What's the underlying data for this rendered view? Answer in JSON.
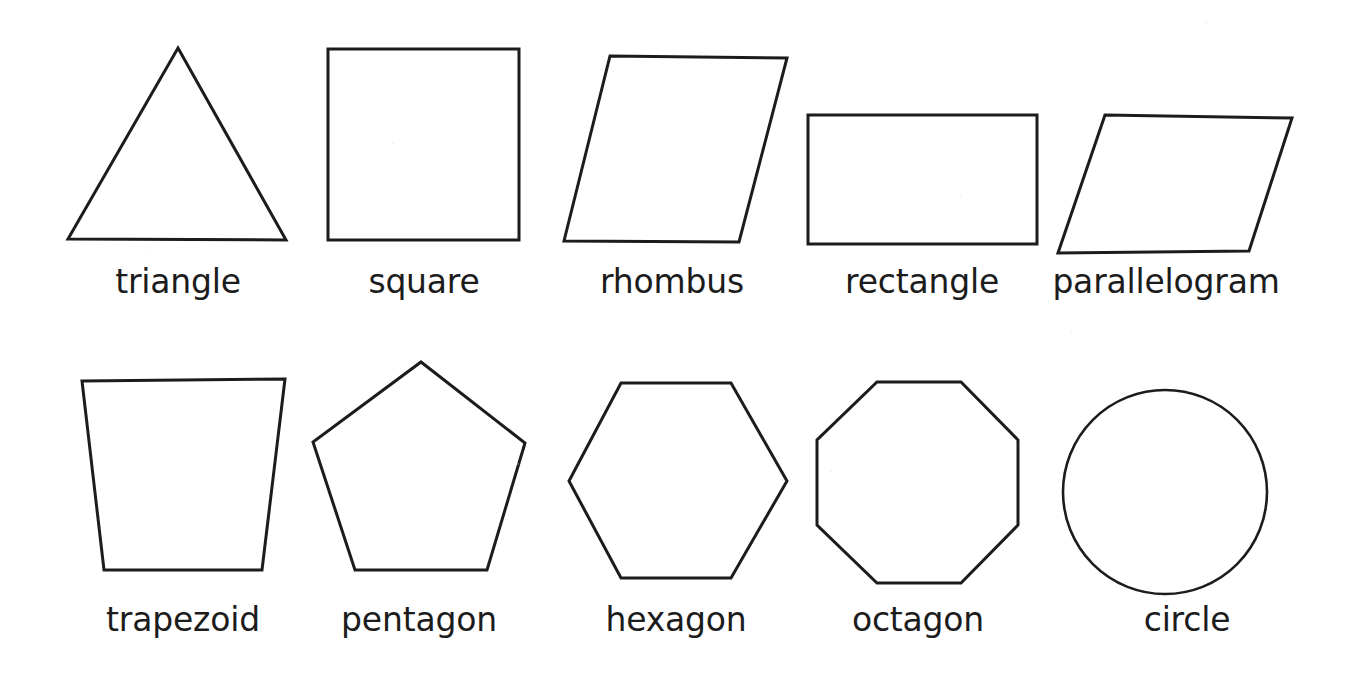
{
  "page": {
    "background_color": "#ffffff",
    "stroke_color": "#1c1c1c",
    "label_color": "#1c1c1c",
    "width": 1356,
    "height": 687,
    "rows": 2,
    "columns": 5
  },
  "chart_data": {
    "type": "diagram",
    "xlabel": "",
    "ylabel": "",
    "legend": [],
    "grid": false,
    "categories": [
      "triangle",
      "square",
      "rhombus",
      "rectangle",
      "parallelogram",
      "trapezoid",
      "pentagon",
      "hexagon",
      "octagon",
      "circle"
    ],
    "values": [
      3,
      4,
      4,
      4,
      4,
      4,
      5,
      6,
      8,
      0
    ],
    "value_meaning": "number of sides (0 = curved, no sides)"
  },
  "shapes": [
    {
      "id": "triangle",
      "label": "triangle",
      "sides": 3,
      "row": 1,
      "column": 1,
      "geometry": "polygon",
      "points": "178,48 286,240 68,239",
      "label_x": 178,
      "label_y": 291
    },
    {
      "id": "square",
      "label": "square",
      "sides": 4,
      "row": 1,
      "column": 2,
      "geometry": "polygon",
      "points": "328,49 519,49 519,240 328,240",
      "label_x": 424,
      "label_y": 291
    },
    {
      "id": "rhombus",
      "label": "rhombus",
      "sides": 4,
      "row": 1,
      "column": 3,
      "geometry": "polygon",
      "points": "610,56 787,58 739,242 564,241",
      "label_x": 672,
      "label_y": 291
    },
    {
      "id": "rectangle",
      "label": "rectangle",
      "sides": 4,
      "row": 1,
      "column": 4,
      "geometry": "polygon",
      "points": "808,115 1037,115 1037,244 808,244",
      "label_x": 922,
      "label_y": 291
    },
    {
      "id": "parallelogram",
      "label": "parallelogram",
      "sides": 4,
      "row": 1,
      "column": 5,
      "geometry": "polygon",
      "points": "1105,115 1292,118 1249,251 1058,253",
      "label_x": 1166,
      "label_y": 291
    },
    {
      "id": "trapezoid",
      "label": "trapezoid",
      "sides": 4,
      "row": 2,
      "column": 1,
      "geometry": "polygon",
      "points": "82,381 285,379 262,570 104,570",
      "label_x": 183,
      "label_y": 629
    },
    {
      "id": "pentagon",
      "label": "pentagon",
      "sides": 5,
      "row": 2,
      "column": 2,
      "geometry": "polygon",
      "points": "421,362 525,443 487,570 355,570 313,442",
      "label_x": 419,
      "label_y": 629
    },
    {
      "id": "hexagon",
      "label": "hexagon",
      "sides": 6,
      "row": 2,
      "column": 3,
      "geometry": "polygon",
      "points": "621,383 731,383 787,481 731,578 621,578 569,481",
      "label_x": 676,
      "label_y": 629
    },
    {
      "id": "octagon",
      "label": "octagon",
      "sides": 8,
      "row": 2,
      "column": 4,
      "geometry": "polygon",
      "points": "877,382 961,382 1018,440 1018,525 961,583 877,583 817,525 817,440",
      "label_x": 918,
      "label_y": 629
    },
    {
      "id": "circle",
      "label": "circle",
      "sides": 0,
      "row": 2,
      "column": 5,
      "geometry": "circle",
      "cx": 1165,
      "cy": 492,
      "r": 102,
      "label_x": 1187,
      "label_y": 629
    }
  ]
}
